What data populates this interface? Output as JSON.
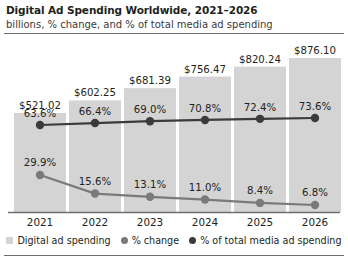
{
  "header": {
    "title": "Digital Ad Spending Worldwide, 2021–2026",
    "subtitle": "billions, % change, and % of total media ad spending"
  },
  "colors": {
    "bar": "#d4d4d4",
    "line_pct_change": "#7a7a7a",
    "line_pct_total": "#3b3b3b",
    "axis": "#6e6e6e",
    "text": "#231f20"
  },
  "legend": {
    "items": [
      {
        "label": "Digital ad spending",
        "marker": "square",
        "color": "#d4d4d4"
      },
      {
        "label": "% change",
        "marker": "dot",
        "color": "#7a7a7a"
      },
      {
        "label": "% of total media ad spending",
        "marker": "dot",
        "color": "#3b3b3b"
      }
    ]
  },
  "chart_data": {
    "type": "bar",
    "title": "Digital Ad Spending Worldwide, 2021–2026",
    "subtitle": "billions, % change, and % of total media ad spending",
    "categories": [
      "2021",
      "2022",
      "2023",
      "2024",
      "2025",
      "2026"
    ],
    "xlabel": "",
    "ylabel": "",
    "grid": false,
    "legend_position": "bottom",
    "series": [
      {
        "name": "Digital ad spending",
        "type": "bar",
        "unit": "billions USD",
        "color": "#d4d4d4",
        "values": [
          521.02,
          602.25,
          681.39,
          756.47,
          820.24,
          876.1
        ],
        "labels": [
          "$521.02",
          "$602.25",
          "$681.39",
          "$756.47",
          "$820.24",
          "$876.10"
        ]
      },
      {
        "name": "% change",
        "type": "line",
        "unit": "percent",
        "color": "#7a7a7a",
        "values": [
          29.9,
          15.6,
          13.1,
          11.0,
          8.4,
          6.8
        ],
        "labels": [
          "29.9%",
          "15.6%",
          "13.1%",
          "11.0%",
          "8.4%",
          "6.8%"
        ]
      },
      {
        "name": "% of total media ad spending",
        "type": "line",
        "unit": "percent",
        "color": "#3b3b3b",
        "values": [
          63.6,
          66.4,
          69.0,
          70.8,
          72.4,
          73.6
        ],
        "labels": [
          "63.6%",
          "66.4%",
          "69.0%",
          "70.8%",
          "72.4%",
          "73.6%"
        ]
      }
    ]
  }
}
